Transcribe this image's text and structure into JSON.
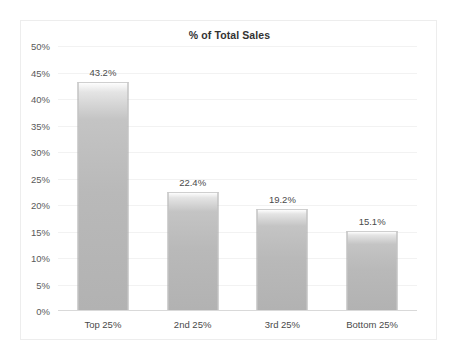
{
  "chart_data": {
    "type": "bar",
    "title": "% of Total Sales",
    "xlabel": "",
    "ylabel": "",
    "categories": [
      "Top 25%",
      "2nd 25%",
      "3rd 25%",
      "Bottom 25%"
    ],
    "values": [
      43.2,
      22.4,
      19.2,
      15.1
    ],
    "data_labels": [
      "43.2%",
      "22.4%",
      "19.2%",
      "15.1%"
    ],
    "ylim": [
      0,
      50
    ],
    "ytick_step": 5,
    "ytick_labels": [
      "50%",
      "45%",
      "40%",
      "35%",
      "30%",
      "25%",
      "20%",
      "15%",
      "10%",
      "5%",
      "0%"
    ],
    "ytick_values": [
      50,
      45,
      40,
      35,
      30,
      25,
      20,
      15,
      10,
      5,
      0
    ],
    "grid": true,
    "legend": false,
    "series": [
      {
        "name": "% of Total Sales",
        "values": [
          43.2,
          22.4,
          19.2,
          15.1
        ]
      }
    ],
    "colors": {
      "bar_fill_top": "#fdfdfd",
      "bar_fill_bottom": "#b2b2b2",
      "bar_border": "#a6a6a6",
      "gridline": "#f2f2f2",
      "axis": "#d9d9d9",
      "text": "#4a4a4a",
      "title": "#333333",
      "background": "#ffffff",
      "frame_border": "#ededed"
    }
  }
}
